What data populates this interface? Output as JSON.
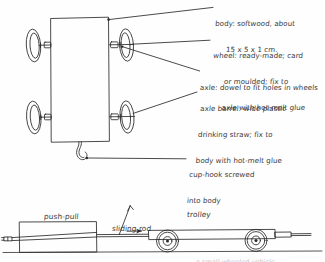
{
  "document": {
    "title": "Trolley construction sketch",
    "ink_color": "#2b2b2b",
    "paper_color": "#fefefe"
  },
  "top_diagram": {
    "name": "trolley-body-assembly-drawing",
    "annotations": [
      {
        "id": "body",
        "lines": [
          "body: softwood, about",
          "15 x 5 x 1 cm."
        ]
      },
      {
        "id": "wheel",
        "lines": [
          "wheel: ready-made; card",
          "or moulded; fix to",
          "axle with hot-melt glue"
        ]
      },
      {
        "id": "axle",
        "lines": [
          "axle: dowel to fit holes in wheels"
        ]
      },
      {
        "id": "axle_barrel",
        "lines": [
          "axle barrel: wide plastic",
          "drinking straw; fix to",
          "body with hot-melt glue"
        ]
      },
      {
        "id": "cup_hook",
        "lines": [
          "cup-hook screwed",
          "into body"
        ]
      }
    ],
    "parts": {
      "body_label": "body",
      "wheel_label": "wheel",
      "axle_label": "axle",
      "axle_barrel_label": "axle barrel",
      "cup_hook_label": "cup-hook"
    }
  },
  "bottom_diagram": {
    "name": "push-pull-and-trolley-side-view",
    "labels": {
      "push_pull": "push-pull",
      "sliding_rod": "sliding rod",
      "trolley": "trolley"
    },
    "cut_off_caption": "a small wheeled vehicle"
  }
}
